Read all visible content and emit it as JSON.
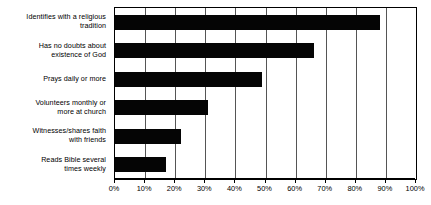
{
  "chart_data": {
    "type": "bar",
    "orientation": "horizontal",
    "title": "",
    "xlabel": "",
    "ylabel": "",
    "xlim": [
      0,
      100
    ],
    "grid": true,
    "legend": false,
    "bar_color": "#050505",
    "axis_color": "#000000",
    "gridline_color": "#555555",
    "categories": [
      "Identifies with a religious tradition",
      "Has no doubts about existence of God",
      "Prays daily or more",
      "Volunteers monthly or more at church",
      "Witnesses/shares faith with friends",
      "Reads Bible several times weekly"
    ],
    "category_lines": [
      [
        "Identifies with a religious",
        "tradition"
      ],
      [
        "Has no doubts about",
        "existence of God"
      ],
      [
        "Prays daily or more"
      ],
      [
        "Volunteers monthly or",
        "more at church"
      ],
      [
        "Witnesses/shares faith",
        "with friends"
      ],
      [
        "Reads Bible several",
        "times weekly"
      ]
    ],
    "values": [
      88,
      66,
      49,
      31,
      22,
      17
    ],
    "tick_values": [
      0,
      10,
      20,
      30,
      40,
      50,
      60,
      70,
      80,
      90,
      100
    ],
    "tick_labels": [
      "0%",
      "10%",
      "20%",
      "30%",
      "40%",
      "50%",
      "60%",
      "70%",
      "80%",
      "90%",
      "100%"
    ]
  }
}
